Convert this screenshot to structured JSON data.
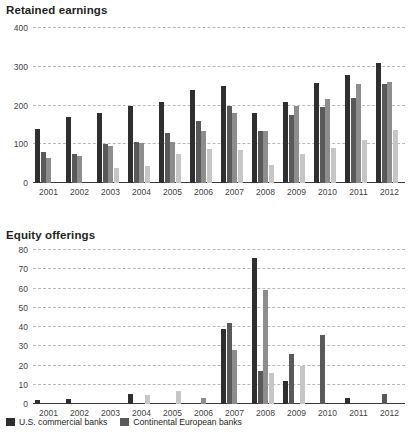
{
  "legend": {
    "items": [
      {
        "label": "U.S. commercial banks",
        "color": "#2f2f2f"
      },
      {
        "label": "Continental European banks",
        "color": "#595959"
      }
    ]
  },
  "series_colors": [
    "#2f2f2f",
    "#595959",
    "#8d8d8d",
    "#c6c6c6"
  ],
  "chart_data": [
    {
      "id": "retained-earnings",
      "type": "bar",
      "title": "Retained earnings",
      "xlabel": "",
      "ylabel": "",
      "ylim": [
        0,
        400
      ],
      "yticks": [
        0,
        100,
        200,
        300,
        400
      ],
      "grid": true,
      "legend_position": "bottom",
      "categories": [
        "2001",
        "2002",
        "2003",
        "2004",
        "2005",
        "2006",
        "2007",
        "2008",
        "2009",
        "2010",
        "2011",
        "2012"
      ],
      "series": [
        {
          "name": "U.S. commercial banks",
          "values": [
            140,
            170,
            180,
            200,
            210,
            240,
            250,
            180,
            210,
            258,
            280,
            310
          ]
        },
        {
          "name": "Continental European banks",
          "values": [
            80,
            74,
            100,
            105,
            130,
            160,
            200,
            135,
            175,
            195,
            220,
            255
          ]
        },
        {
          "name": "Series 3",
          "values": [
            65,
            70,
            95,
            103,
            105,
            135,
            180,
            135,
            198,
            218,
            255,
            260
          ]
        },
        {
          "name": "Series 4",
          "values": [
            0,
            0,
            40,
            45,
            75,
            88,
            85,
            46,
            75,
            90,
            110,
            138
          ]
        }
      ]
    },
    {
      "id": "equity-offerings",
      "type": "bar",
      "title": "Equity offerings",
      "xlabel": "",
      "ylabel": "",
      "ylim": [
        0,
        80
      ],
      "yticks": [
        0,
        10,
        20,
        30,
        40,
        50,
        60,
        70,
        80
      ],
      "grid": true,
      "legend_position": "bottom",
      "categories": [
        "2001",
        "2002",
        "2003",
        "2004",
        "2005",
        "2006",
        "2007",
        "2008",
        "2009",
        "2010",
        "2011",
        "2012"
      ],
      "series": [
        {
          "name": "U.S. commercial banks",
          "values": [
            2,
            2.5,
            0,
            5,
            0,
            0,
            39,
            76,
            12,
            0,
            3,
            0
          ]
        },
        {
          "name": "Continental European banks",
          "values": [
            0,
            0,
            0,
            0,
            0,
            0,
            42,
            17,
            26,
            36,
            0,
            5
          ]
        },
        {
          "name": "Series 3",
          "values": [
            0,
            0,
            0,
            0,
            0,
            3,
            28,
            59,
            0,
            0,
            0,
            0
          ]
        },
        {
          "name": "Series 4",
          "values": [
            0,
            0,
            0,
            4.5,
            7,
            0,
            0,
            16,
            20,
            0,
            0,
            0
          ]
        }
      ]
    }
  ]
}
